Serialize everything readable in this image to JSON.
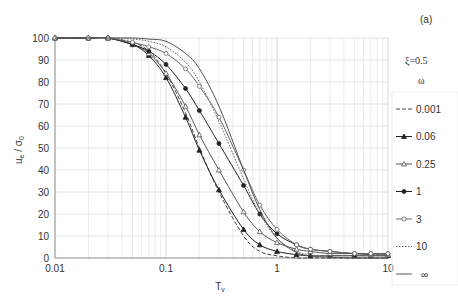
{
  "panel_label": "(a)",
  "legend_title": "ξ=0.5",
  "legend_subtitle": "ω",
  "chart_data": {
    "type": "line",
    "title": "",
    "xlabel": "Tv",
    "ylabel": "ue / σ0",
    "xscale": "log",
    "xlim": [
      0.01,
      10
    ],
    "ylim": [
      0,
      100
    ],
    "xticks": [
      "0.01",
      "0.1",
      "1",
      "10"
    ],
    "yticks": [
      "0",
      "10",
      "20",
      "30",
      "40",
      "50",
      "60",
      "70",
      "80",
      "90",
      "100"
    ],
    "grid": true,
    "legend_position": "right",
    "x": [
      0.01,
      0.02,
      0.03,
      0.05,
      0.07,
      0.1,
      0.15,
      0.2,
      0.3,
      0.5,
      0.7,
      1,
      1.5,
      2,
      3,
      5,
      7,
      10
    ],
    "series": [
      {
        "name": "0.001",
        "style": "dashed",
        "marker": "none",
        "values": [
          100,
          100,
          100,
          98,
          94,
          84,
          66,
          50,
          30,
          10,
          3,
          1,
          0,
          0,
          0,
          0,
          0,
          0
        ]
      },
      {
        "name": "0.06",
        "style": "solid",
        "marker": "triangle-filled",
        "values": [
          100,
          100,
          100,
          97,
          92,
          82,
          64,
          49,
          31,
          13,
          6,
          3,
          1.5,
          1,
          1,
          1,
          1,
          1
        ]
      },
      {
        "name": "0.25",
        "style": "solid",
        "marker": "triangle-open",
        "values": [
          100,
          100,
          100,
          97,
          93,
          84,
          69,
          56,
          40,
          21,
          12,
          7,
          4,
          3,
          2,
          2,
          1.5,
          1.5
        ]
      },
      {
        "name": "1",
        "style": "solid",
        "marker": "circle-filled",
        "values": [
          100,
          100,
          100,
          97,
          94,
          88,
          77,
          67,
          52,
          33,
          20,
          11,
          6,
          4,
          3,
          2,
          2,
          2
        ]
      },
      {
        "name": "3",
        "style": "solid",
        "marker": "circle-open",
        "values": [
          100,
          100,
          100,
          98,
          96,
          93,
          86,
          78,
          64,
          40,
          24,
          13,
          6,
          4,
          3,
          2,
          2,
          2
        ]
      },
      {
        "name": "10",
        "style": "dotted",
        "marker": "none",
        "values": [
          100,
          100,
          100,
          99.5,
          98.5,
          96,
          89,
          80,
          62,
          36,
          20,
          9,
          3,
          1.5,
          0.5,
          0,
          0,
          0
        ]
      },
      {
        "name": "∞",
        "style": "solid",
        "marker": "none",
        "values": [
          100,
          100,
          100,
          100,
          99.5,
          98.5,
          93,
          86,
          69,
          40,
          22,
          9,
          2.5,
          1,
          0.3,
          0,
          0,
          0
        ]
      }
    ]
  }
}
